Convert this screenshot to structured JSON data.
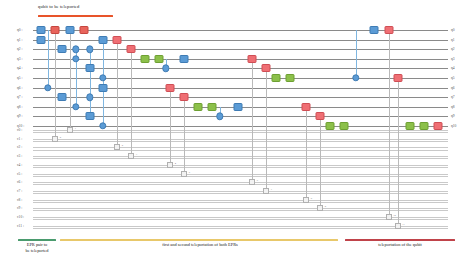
{
  "annotation": {
    "top_label": "qubit to be teleported",
    "top_bar_color": "#e8542a"
  },
  "quantum_wires": [
    {
      "left": "q0 :",
      "right": "q0"
    },
    {
      "left": "q1 :",
      "right": "q1"
    },
    {
      "left": "q2 :",
      "right": "q2"
    },
    {
      "left": "q3 :",
      "right": "q3"
    },
    {
      "left": "q4 :",
      "right": "q4"
    },
    {
      "left": "q5 :",
      "right": "q5"
    },
    {
      "left": "q6 :",
      "right": "q6"
    },
    {
      "left": "q7 :",
      "right": "q7"
    },
    {
      "left": "q8 :",
      "right": "q8"
    },
    {
      "left": "q9 :",
      "right": "q9"
    },
    {
      "left": "q10 :",
      "right": "q10"
    }
  ],
  "classical_wires": [
    {
      "left": "c0 :"
    },
    {
      "left": "c1 :"
    },
    {
      "left": "c2 :"
    },
    {
      "left": "c3 :"
    },
    {
      "left": "c4 :"
    },
    {
      "left": "c5 :"
    },
    {
      "left": "c6 :"
    },
    {
      "left": "c7 :"
    },
    {
      "left": "c8 :"
    },
    {
      "left": "c9 :"
    },
    {
      "left": "c10 :"
    },
    {
      "left": "c11 :"
    }
  ],
  "gates": [
    {
      "x": 41,
      "row": 0,
      "color": "blue",
      "w": 7,
      "h": 6
    },
    {
      "x": 55,
      "row": 0,
      "color": "red",
      "w": 7,
      "h": 6
    },
    {
      "x": 70,
      "row": 0,
      "color": "blue",
      "w": 7,
      "h": 6
    },
    {
      "x": 84,
      "row": 0,
      "color": "red",
      "w": 7,
      "h": 6
    },
    {
      "x": 374,
      "row": 0,
      "color": "blue",
      "w": 7,
      "h": 6
    },
    {
      "x": 389,
      "row": 0,
      "color": "pink",
      "w": 7,
      "h": 6
    },
    {
      "x": 41,
      "row": 1,
      "color": "blue",
      "w": 7,
      "h": 6
    },
    {
      "x": 103,
      "row": 1,
      "color": "blue",
      "w": 7,
      "h": 6
    },
    {
      "x": 117,
      "row": 1,
      "color": "pink",
      "w": 7,
      "h": 6
    },
    {
      "x": 62,
      "row": 2,
      "color": "blue",
      "w": 7,
      "h": 6
    },
    {
      "x": 131,
      "row": 2,
      "color": "pink",
      "w": 7,
      "h": 6
    },
    {
      "x": 145,
      "row": 3,
      "color": "green",
      "w": 7,
      "h": 6
    },
    {
      "x": 159,
      "row": 3,
      "color": "green",
      "w": 7,
      "h": 6
    },
    {
      "x": 184,
      "row": 3,
      "color": "blue",
      "w": 7,
      "h": 6
    },
    {
      "x": 252,
      "row": 3,
      "color": "pink",
      "w": 7,
      "h": 6
    },
    {
      "x": 90,
      "row": 4,
      "color": "blue",
      "w": 7,
      "h": 6
    },
    {
      "x": 266,
      "row": 4,
      "color": "pink",
      "w": 7,
      "h": 6
    },
    {
      "x": 276,
      "row": 5,
      "color": "green",
      "w": 7,
      "h": 6
    },
    {
      "x": 290,
      "row": 5,
      "color": "green",
      "w": 7,
      "h": 6
    },
    {
      "x": 398,
      "row": 5,
      "color": "pink",
      "w": 7,
      "h": 6
    },
    {
      "x": 103,
      "row": 6,
      "color": "blue",
      "w": 7,
      "h": 6
    },
    {
      "x": 170,
      "row": 6,
      "color": "pink",
      "w": 7,
      "h": 6
    },
    {
      "x": 62,
      "row": 7,
      "color": "blue",
      "w": 7,
      "h": 6
    },
    {
      "x": 184,
      "row": 7,
      "color": "pink",
      "w": 7,
      "h": 6
    },
    {
      "x": 198,
      "row": 8,
      "color": "green",
      "w": 7,
      "h": 6
    },
    {
      "x": 212,
      "row": 8,
      "color": "green",
      "w": 7,
      "h": 6
    },
    {
      "x": 238,
      "row": 8,
      "color": "blue",
      "w": 7,
      "h": 6
    },
    {
      "x": 306,
      "row": 8,
      "color": "pink",
      "w": 7,
      "h": 6
    },
    {
      "x": 90,
      "row": 9,
      "color": "blue",
      "w": 7,
      "h": 6
    },
    {
      "x": 320,
      "row": 9,
      "color": "pink",
      "w": 7,
      "h": 6
    },
    {
      "x": 330,
      "row": 10,
      "color": "green",
      "w": 7,
      "h": 6
    },
    {
      "x": 344,
      "row": 10,
      "color": "green",
      "w": 7,
      "h": 6
    },
    {
      "x": 410,
      "row": 10,
      "color": "green",
      "w": 7,
      "h": 6
    },
    {
      "x": 424,
      "row": 10,
      "color": "green",
      "w": 7,
      "h": 6
    },
    {
      "x": 438,
      "row": 10,
      "color": "pink",
      "w": 7,
      "h": 6
    }
  ],
  "controls": [
    {
      "x": 48,
      "row": 6,
      "open": false
    },
    {
      "x": 76,
      "row": 2,
      "open": false
    },
    {
      "x": 76,
      "row": 3,
      "open": false
    },
    {
      "x": 76,
      "row": 8,
      "open": false
    },
    {
      "x": 90,
      "row": 2,
      "open": false
    },
    {
      "x": 90,
      "row": 7,
      "open": false
    },
    {
      "x": 103,
      "row": 5,
      "open": false
    },
    {
      "x": 103,
      "row": 10,
      "open": false
    },
    {
      "x": 166,
      "row": 4,
      "open": false
    },
    {
      "x": 220,
      "row": 9,
      "open": false
    },
    {
      "x": 356,
      "row": 5,
      "open": false
    }
  ],
  "cnot_links": [
    {
      "x": 48,
      "from": 0,
      "to": 6
    },
    {
      "x": 76,
      "from": 2,
      "to": 8
    },
    {
      "x": 90,
      "from": 2,
      "to": 9
    },
    {
      "x": 103,
      "from": 1,
      "to": 10
    },
    {
      "x": 166,
      "from": 3,
      "to": 4
    },
    {
      "x": 220,
      "from": 8,
      "to": 9
    },
    {
      "x": 356,
      "from": 0,
      "to": 5
    }
  ],
  "measurements": [
    {
      "x": 55,
      "row": 0,
      "crow": 1,
      "index": "0"
    },
    {
      "x": 70,
      "row": 0,
      "crow": 0,
      "index": "1"
    },
    {
      "x": 117,
      "row": 1,
      "crow": 2,
      "index": "2"
    },
    {
      "x": 131,
      "row": 2,
      "crow": 3,
      "index": "3"
    },
    {
      "x": 170,
      "row": 6,
      "crow": 4,
      "index": "4"
    },
    {
      "x": 184,
      "row": 7,
      "crow": 5,
      "index": "5"
    },
    {
      "x": 252,
      "row": 3,
      "crow": 6,
      "index": "6"
    },
    {
      "x": 266,
      "row": 4,
      "crow": 7,
      "index": "7"
    },
    {
      "x": 306,
      "row": 8,
      "crow": 8,
      "index": "8"
    },
    {
      "x": 320,
      "row": 9,
      "crow": 9,
      "index": "9"
    },
    {
      "x": 389,
      "row": 0,
      "crow": 10,
      "index": "10"
    },
    {
      "x": 398,
      "row": 5,
      "crow": 11,
      "index": "11"
    }
  ],
  "legend": [
    {
      "label": "EPR pair to\nbe teleported",
      "color": "#4a9b6e",
      "x": 18,
      "width": 38,
      "text_x": 8,
      "text_w": 58
    },
    {
      "label": "first and second teleportation of both EPRs",
      "color": "#e8c86a",
      "x": 60,
      "width": 278,
      "text_x": 110,
      "text_w": 180
    },
    {
      "label": "teleportation of the qubit",
      "color": "#c0434a",
      "x": 345,
      "width": 110,
      "text_x": 348,
      "text_w": 104
    }
  ]
}
